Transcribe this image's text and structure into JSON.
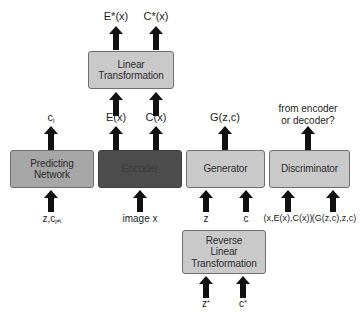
{
  "diagram": {
    "colors": {
      "box_light": "#c9c9c9",
      "box_mid": "#a6a6a6",
      "box_dark": "#4d4d4d",
      "box_border": "#6e6e6e",
      "arrow": "#111111",
      "background": "#ffffff",
      "text": "#1d1d1d"
    },
    "boxes": [
      {
        "id": "predicting-network",
        "label_line1": "Predicting",
        "label_line2": "Network",
        "shade": "mid"
      },
      {
        "id": "encoder",
        "label_line1": "Encoder",
        "label_line2": "",
        "shade": "dark"
      },
      {
        "id": "generator",
        "label_line1": "Generator",
        "label_line2": "",
        "shade": "light"
      },
      {
        "id": "discriminator",
        "label_line1": "Discriminator",
        "label_line2": "",
        "shade": "light"
      },
      {
        "id": "linear-transformation",
        "label_line1": "Linear",
        "label_line2": "Transformation",
        "shade": "light"
      },
      {
        "id": "reverse-linear-transformation",
        "label_line1": "Reverse",
        "label_line2": "Linear",
        "label_line3": "Transformation",
        "shade": "light"
      }
    ],
    "labels": {
      "e_star_x": "E*(x)",
      "c_star_x": "C*(x)",
      "e_x": "E(x)",
      "c_x": "C(x)",
      "c_i": "c",
      "c_i_sub": "i",
      "g_z_c": "G(z,c)",
      "from_encoder_line1": "from encoder",
      "from_encoder_line2": "or decoder?",
      "input_predicting": "z,c",
      "input_predicting_sub": "j≠i",
      "input_encoder": "image x",
      "input_generator_z": "z",
      "input_generator_c": "c",
      "input_disc_real": "(x,E(x),C(x))",
      "input_disc_fake": "(G(z,c),z,c)",
      "input_reverse_z": "z",
      "input_reverse_z_sup": "*",
      "input_reverse_c": "c",
      "input_reverse_c_sup": "*"
    }
  }
}
